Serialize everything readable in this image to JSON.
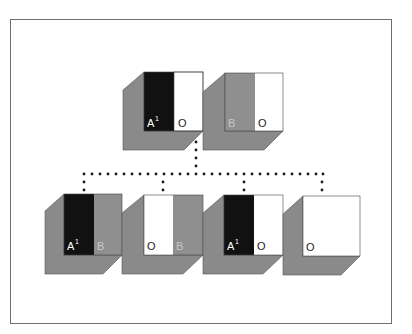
{
  "diagram": {
    "type": "hierarchy",
    "colors": {
      "shadow_gray": "#8a8a8a",
      "panel_gray": "#8f8f8f",
      "panel_black": "#111111",
      "panel_white": "#ffffff",
      "frame": "#6e6e6e",
      "dots": "#1a1a1a"
    },
    "parents": [
      {
        "id": "parent-1",
        "left_panel": {
          "fill": "black",
          "label": "A",
          "superscript": "1"
        },
        "right_panel": {
          "fill": "white",
          "label": "O"
        }
      },
      {
        "id": "parent-2",
        "left_panel": {
          "fill": "gray",
          "label": "B"
        },
        "right_panel": {
          "fill": "white",
          "label": "O"
        }
      }
    ],
    "children": [
      {
        "id": "child-1",
        "left_panel": {
          "fill": "black",
          "label": "A",
          "superscript": "1"
        },
        "right_panel": {
          "fill": "gray",
          "label": "B"
        }
      },
      {
        "id": "child-2",
        "left_panel": {
          "fill": "white",
          "label": "O"
        },
        "right_panel": {
          "fill": "gray",
          "label": "B"
        }
      },
      {
        "id": "child-3",
        "left_panel": {
          "fill": "black",
          "label": "A",
          "superscript": "1"
        },
        "right_panel": {
          "fill": "white",
          "label": "O"
        }
      },
      {
        "id": "child-4",
        "left_panel": {
          "fill": "white",
          "label": "O"
        },
        "right_panel": {
          "fill": "white",
          "label": ""
        }
      }
    ],
    "connector": {
      "style": "dotted",
      "from": "parents",
      "to": "children"
    }
  }
}
